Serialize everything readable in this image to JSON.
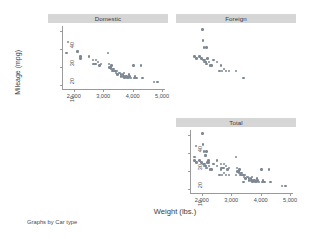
{
  "note": "Graphs by Car type",
  "chart_data": {
    "type": "scatter",
    "title": "",
    "xlabel": "Weight (lbs.)",
    "ylabel": "Mileage (mpg)",
    "xlim": [
      1600,
      5100
    ],
    "ylim": [
      8,
      43
    ],
    "xticks": [
      2000,
      3000,
      4000,
      5000
    ],
    "xticklabels": [
      "2,000",
      "3,000",
      "4,000",
      "5,000"
    ],
    "yticks": [
      10,
      20,
      30,
      40
    ],
    "yticklabels": [
      "10",
      "20",
      "30",
      "40"
    ],
    "grid": false,
    "legend": "none",
    "marker_color": "#7d8894",
    "panel_title_bg": "#d6d6d6",
    "panel_title_color": "#3a3a3a",
    "by_variable": "Car type",
    "layout": "2x2 grid, bottom-left cell empty",
    "panels": [
      {
        "name": "domestic",
        "label": "Domestic",
        "position": "top-left",
        "show_xticklabels": true,
        "show_yticklabels": true,
        "points": [
          [
            1800,
            34
          ],
          [
            1760,
            28
          ],
          [
            2120,
            29
          ],
          [
            2130,
            28.5
          ],
          [
            2230,
            26
          ],
          [
            2230,
            25
          ],
          [
            2520,
            26
          ],
          [
            2650,
            24
          ],
          [
            2670,
            22
          ],
          [
            2730,
            22
          ],
          [
            2750,
            24
          ],
          [
            2830,
            23
          ],
          [
            2880,
            21
          ],
          [
            2930,
            22
          ],
          [
            3170,
            28
          ],
          [
            3200,
            22
          ],
          [
            3210,
            20
          ],
          [
            3250,
            20
          ],
          [
            3260,
            19
          ],
          [
            3280,
            21
          ],
          [
            3300,
            19
          ],
          [
            3310,
            18
          ],
          [
            3350,
            19
          ],
          [
            3380,
            18
          ],
          [
            3420,
            18
          ],
          [
            3430,
            17
          ],
          [
            3470,
            18
          ],
          [
            3490,
            16
          ],
          [
            3530,
            17
          ],
          [
            3570,
            17
          ],
          [
            3600,
            16
          ],
          [
            3610,
            15
          ],
          [
            3670,
            16
          ],
          [
            3690,
            15
          ],
          [
            3700,
            17
          ],
          [
            3720,
            14
          ],
          [
            3740,
            15
          ],
          [
            3790,
            15
          ],
          [
            3830,
            14
          ],
          [
            3870,
            16
          ],
          [
            3880,
            14
          ],
          [
            3900,
            15
          ],
          [
            3940,
            14
          ],
          [
            4030,
            21
          ],
          [
            4060,
            14
          ],
          [
            4080,
            15
          ],
          [
            4130,
            14
          ],
          [
            4290,
            21
          ],
          [
            4330,
            14
          ],
          [
            4720,
            12
          ],
          [
            4840,
            12
          ]
        ]
      },
      {
        "name": "foreign",
        "label": "Foreign",
        "position": "top-right",
        "show_xticklabels": false,
        "show_yticklabels": false,
        "points": [
          [
            2020,
            41
          ],
          [
            2040,
            35
          ],
          [
            2070,
            31
          ],
          [
            2160,
            31
          ],
          [
            1760,
            26
          ],
          [
            1830,
            25
          ],
          [
            1930,
            26
          ],
          [
            1990,
            25
          ],
          [
            2050,
            24
          ],
          [
            2070,
            23
          ],
          [
            2100,
            24
          ],
          [
            2120,
            23
          ],
          [
            2150,
            23
          ],
          [
            2160,
            22
          ],
          [
            2200,
            25
          ],
          [
            2240,
            23
          ],
          [
            2280,
            21
          ],
          [
            2330,
            21
          ],
          [
            2400,
            24
          ],
          [
            2520,
            23
          ],
          [
            2600,
            18
          ],
          [
            2650,
            21
          ],
          [
            2690,
            18
          ],
          [
            2750,
            19
          ],
          [
            2830,
            18
          ],
          [
            2930,
            18
          ],
          [
            3170,
            18
          ],
          [
            3420,
            14
          ]
        ]
      },
      {
        "name": "total",
        "label": "Total",
        "position": "bottom-right",
        "show_xticklabels": true,
        "show_yticklabels": true,
        "points": [
          [
            2020,
            41
          ],
          [
            1800,
            34
          ],
          [
            2040,
            35
          ],
          [
            1760,
            28
          ],
          [
            2120,
            29
          ],
          [
            2130,
            28.5
          ],
          [
            2070,
            31
          ],
          [
            2160,
            31
          ],
          [
            2230,
            26
          ],
          [
            2230,
            25
          ],
          [
            1760,
            26
          ],
          [
            1830,
            25
          ],
          [
            1930,
            26
          ],
          [
            1990,
            25
          ],
          [
            2050,
            24
          ],
          [
            2070,
            23
          ],
          [
            2100,
            24
          ],
          [
            2120,
            23
          ],
          [
            2150,
            23
          ],
          [
            2160,
            22
          ],
          [
            2200,
            25
          ],
          [
            2240,
            23
          ],
          [
            2280,
            21
          ],
          [
            2330,
            21
          ],
          [
            2400,
            24
          ],
          [
            2520,
            26
          ],
          [
            2520,
            23
          ],
          [
            2600,
            18
          ],
          [
            2650,
            24
          ],
          [
            2650,
            21
          ],
          [
            2670,
            22
          ],
          [
            2690,
            18
          ],
          [
            2730,
            22
          ],
          [
            2750,
            24
          ],
          [
            2750,
            19
          ],
          [
            2830,
            23
          ],
          [
            2830,
            18
          ],
          [
            2880,
            21
          ],
          [
            2930,
            22
          ],
          [
            2930,
            18
          ],
          [
            3170,
            28
          ],
          [
            3170,
            18
          ],
          [
            3200,
            22
          ],
          [
            3210,
            20
          ],
          [
            3250,
            20
          ],
          [
            3260,
            19
          ],
          [
            3280,
            21
          ],
          [
            3300,
            19
          ],
          [
            3310,
            18
          ],
          [
            3350,
            19
          ],
          [
            3380,
            18
          ],
          [
            3420,
            18
          ],
          [
            3420,
            14
          ],
          [
            3430,
            17
          ],
          [
            3470,
            18
          ],
          [
            3490,
            16
          ],
          [
            3530,
            17
          ],
          [
            3570,
            17
          ],
          [
            3600,
            16
          ],
          [
            3610,
            15
          ],
          [
            3670,
            16
          ],
          [
            3690,
            15
          ],
          [
            3700,
            17
          ],
          [
            3720,
            14
          ],
          [
            3740,
            15
          ],
          [
            3790,
            15
          ],
          [
            3830,
            14
          ],
          [
            3870,
            16
          ],
          [
            3880,
            14
          ],
          [
            3900,
            15
          ],
          [
            3940,
            14
          ],
          [
            4030,
            21
          ],
          [
            4060,
            14
          ],
          [
            4080,
            15
          ],
          [
            4130,
            14
          ],
          [
            4290,
            21
          ],
          [
            4330,
            14
          ],
          [
            4720,
            12
          ],
          [
            4840,
            12
          ]
        ]
      }
    ]
  }
}
